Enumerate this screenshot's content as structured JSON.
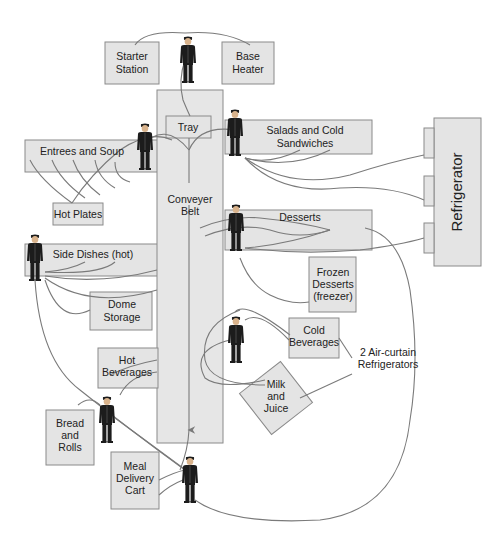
{
  "diagram": {
    "stations": {
      "starter_station": [
        "Starter",
        "Station"
      ],
      "base_heater": [
        "Base",
        "Heater"
      ],
      "tray": "Tray",
      "conveyer_belt": [
        "Conveyer",
        "Belt"
      ],
      "entrees_and_soup": "Entrees and Soup",
      "hot_plates": "Hot Plates",
      "salads_cold_sandwiches": [
        "Salads and Cold",
        "Sandwiches"
      ],
      "refrigerator": "Refrigerator",
      "desserts": "Desserts",
      "frozen_desserts": [
        "Frozen",
        "Desserts",
        "(freezer)"
      ],
      "side_dishes_hot": "Side Dishes (hot)",
      "dome_storage": [
        "Dome",
        "Storage"
      ],
      "cold_beverages": [
        "Cold",
        "Beverages"
      ],
      "air_curtain_refrigerators": [
        "2 Air-curtain",
        "Refrigerators"
      ],
      "hot_beverages": [
        "Hot",
        "Beverages"
      ],
      "milk_and_juice": [
        "Milk",
        "and",
        "Juice"
      ],
      "bread_and_rolls": [
        "Bread",
        "and",
        "Rolls"
      ],
      "meal_delivery_cart": [
        "Meal",
        "Delivery",
        "Cart"
      ]
    },
    "workers": [
      "worker-starter",
      "worker-salads",
      "worker-entrees",
      "worker-desserts",
      "worker-side-dishes",
      "worker-beverages",
      "worker-bread",
      "worker-cart"
    ]
  }
}
